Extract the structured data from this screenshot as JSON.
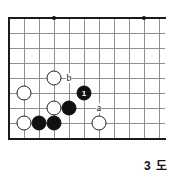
{
  "diagram": {
    "type": "go-board-problem-diagram",
    "caption": "3 도",
    "board": {
      "columns": 11,
      "rows": 9,
      "origin_x": 9,
      "origin_y": 18,
      "cell": 15,
      "edges": [
        "left",
        "top",
        "bottom"
      ],
      "line_color": "#8f8f8f",
      "edge_color": "#1a1a1a",
      "background": "#ffffff"
    },
    "star_points": [
      {
        "col": 3,
        "row": 0
      },
      {
        "col": 9,
        "row": 0
      }
    ],
    "marker_dots": [
      {
        "col": 4,
        "row": 6
      }
    ],
    "stones": [
      {
        "color": "white",
        "col": 3,
        "row": 4,
        "label": ""
      },
      {
        "color": "white",
        "col": 1,
        "row": 5,
        "label": ""
      },
      {
        "color": "white",
        "col": 3,
        "row": 6,
        "label": ""
      },
      {
        "color": "white",
        "col": 1,
        "row": 7,
        "label": ""
      },
      {
        "color": "white",
        "col": 6,
        "row": 7,
        "label": ""
      },
      {
        "color": "black",
        "col": 5,
        "row": 5,
        "label": "1"
      },
      {
        "color": "black",
        "col": 4,
        "row": 6,
        "label": ""
      },
      {
        "color": "black",
        "col": 2,
        "row": 7,
        "label": ""
      },
      {
        "color": "black",
        "col": 3,
        "row": 7,
        "label": ""
      }
    ],
    "point_labels": [
      {
        "text": "b",
        "col": 4,
        "row": 4
      },
      {
        "text": "a",
        "col": 6,
        "row": 6
      }
    ]
  }
}
